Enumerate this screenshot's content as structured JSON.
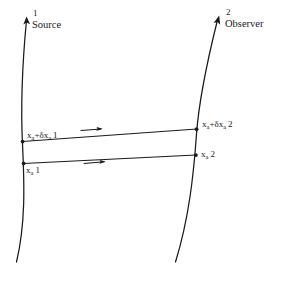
{
  "figure": {
    "title": "",
    "background_color": "#ffffff",
    "ink_color": "#1a1a1a",
    "width": 286,
    "height": 281
  },
  "worldlines": [
    {
      "id": "source",
      "number": "1",
      "name": "Source",
      "arrow_direction": "up"
    },
    {
      "id": "observer",
      "number": "2",
      "name": "Observer",
      "arrow_direction": "up-right"
    }
  ],
  "events": [
    {
      "id": "upper-left",
      "base": "x",
      "subscript": "a",
      "delta": "δ",
      "text": "x",
      "sub": "a",
      "plus": "+",
      "delta_sym": "δ",
      "index": "1",
      "full": "xₐ+δxₐ 1"
    },
    {
      "id": "lower-left",
      "text": "x",
      "sub": "a",
      "index": "1",
      "full": "xₐ 1"
    },
    {
      "id": "upper-right",
      "text": "x",
      "sub": "a",
      "plus": "+",
      "delta_sym": "δ",
      "index": "2",
      "full": "xₐ+δxₐ 2"
    },
    {
      "id": "lower-right",
      "text": "x",
      "sub": "a",
      "index": "2",
      "full": "xₐ 2"
    }
  ],
  "labels": {
    "source_number": "1",
    "source_name": "Source",
    "observer_number": "2",
    "observer_name": "Observer",
    "upper_left_x": "x",
    "upper_left_sub": "a",
    "upper_left_plus": "+",
    "upper_left_delta": "δ",
    "upper_left_x2": "x",
    "upper_left_sub2": "a",
    "upper_left_index": "1",
    "lower_left_x": "x",
    "lower_left_sub": "a",
    "lower_left_index": "1",
    "upper_right_x": "x",
    "upper_right_sub": "a",
    "upper_right_plus": "+",
    "upper_right_delta": "δ",
    "upper_right_x2": "x",
    "upper_right_sub2": "a",
    "upper_right_index": "2",
    "lower_right_x": "x",
    "lower_right_sub": "a",
    "lower_right_index": "2"
  },
  "connectors": [
    {
      "id": "upper-ray",
      "from": "upper-left",
      "to": "upper-right",
      "arrow": "right"
    },
    {
      "id": "lower-ray",
      "from": "lower-left",
      "to": "lower-right",
      "arrow": "right"
    }
  ]
}
